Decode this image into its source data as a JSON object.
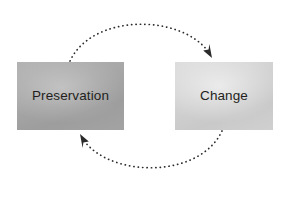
{
  "diagram": {
    "type": "cycle-diagram",
    "background_color": "#ffffff",
    "nodes": [
      {
        "id": "preservation",
        "label": "Preservation",
        "fill_color": "#a8a8a8",
        "text_color": "#231f20"
      },
      {
        "id": "change",
        "label": "Change",
        "fill_color": "#d2d2d2",
        "text_color": "#231f20"
      }
    ],
    "connectors": [
      {
        "id": "top-arc",
        "from": "preservation",
        "to": "change",
        "style": "dotted",
        "direction": "clockwise",
        "color": "#2b2b2b",
        "arrowhead": "end"
      },
      {
        "id": "bottom-arc",
        "from": "change",
        "to": "preservation",
        "style": "dotted",
        "direction": "clockwise",
        "color": "#2b2b2b",
        "arrowhead": "end"
      }
    ]
  }
}
